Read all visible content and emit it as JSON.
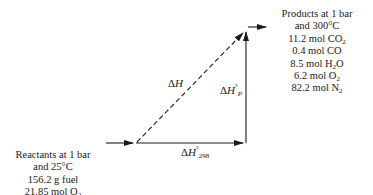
{
  "reactants": {
    "lines": [
      {
        "text": "Reactants at 1 bar"
      },
      {
        "text": "and 25°C"
      },
      {
        "text": "156.2 g fuel"
      },
      {
        "text": "21.85 mol O",
        "sub": "2"
      },
      {
        "text": "82.2 mol N",
        "sub": "2"
      }
    ]
  },
  "products": {
    "lines": [
      {
        "text": "Products at 1 bar"
      },
      {
        "text": "and 300°C"
      },
      {
        "text": "11.2 mol CO",
        "sub": "2"
      },
      {
        "text": "0.4 mol CO"
      },
      {
        "text": "8.5 mol H",
        "sub": "2",
        "after": "O"
      },
      {
        "text": "6.2 mol O",
        "sub": "2"
      },
      {
        "text": "82.2 mol N",
        "sub": "2"
      }
    ]
  },
  "labels": {
    "delta_h": {
      "prefix": "Δ",
      "symbol": "H"
    },
    "delta_h_p": {
      "prefix": "Δ",
      "symbol": "H",
      "sup": "°",
      "sub": "P"
    },
    "delta_h_298": {
      "prefix": "Δ",
      "symbol": "H",
      "sup": "°",
      "sub": "298"
    }
  },
  "colors": {
    "line": "#1a1a1a",
    "background": "#ffffff"
  }
}
